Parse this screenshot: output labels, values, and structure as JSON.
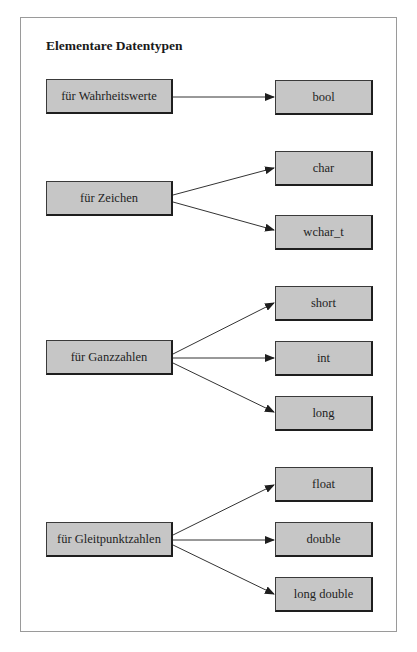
{
  "diagram": {
    "title": "Elementare Datentypen",
    "groups": [
      {
        "category": "für Wahrheitswerte",
        "types": [
          "bool"
        ]
      },
      {
        "category": "für Zeichen",
        "types": [
          "char",
          "wchar_t"
        ]
      },
      {
        "category": "für Ganzzahlen",
        "types": [
          "short",
          "int",
          "long"
        ]
      },
      {
        "category": "für Gleitpunktzahlen",
        "types": [
          "float",
          "double",
          "long double"
        ]
      }
    ]
  },
  "colors": {
    "node_fill": "#c6c6c6",
    "node_border": "#1e1e1e",
    "frame_border": "#9a9a9a",
    "arrow": "#333333"
  }
}
